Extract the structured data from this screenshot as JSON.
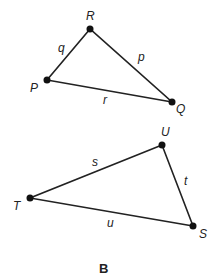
{
  "figure": {
    "caption": "B",
    "triangle1": {
      "vertices": {
        "R": "R",
        "P": "P",
        "Q": "Q"
      },
      "sides": {
        "q": "q",
        "p": "p",
        "r": "r"
      }
    },
    "triangle2": {
      "vertices": {
        "U": "U",
        "T": "T",
        "S": "S"
      },
      "sides": {
        "s": "s",
        "t": "t",
        "u": "u"
      }
    }
  }
}
